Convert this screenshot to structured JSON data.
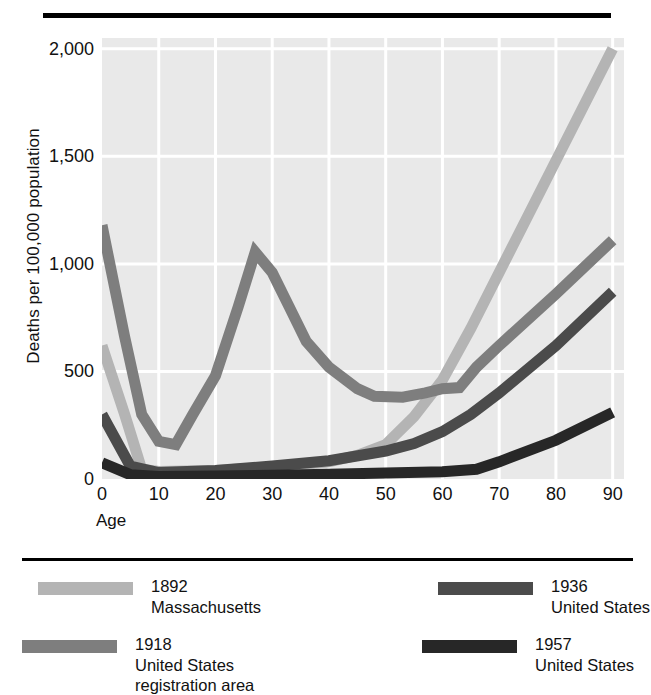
{
  "chart_data": {
    "type": "line",
    "title": "",
    "xlabel": "Age",
    "ylabel": "Deaths per 100,000 population",
    "xlim": [
      0,
      92
    ],
    "ylim": [
      0,
      2050
    ],
    "xticks": [
      0,
      10,
      20,
      30,
      40,
      50,
      60,
      70,
      80,
      90
    ],
    "xticklabels": [
      "0",
      "10",
      "20",
      "30",
      "40",
      "50",
      "60",
      "70",
      "80",
      "90"
    ],
    "yticks": [
      0,
      500,
      1000,
      1500,
      2000
    ],
    "yticklabels": [
      "0",
      "500",
      "1,000",
      "1,500",
      "2,000"
    ],
    "grid": true,
    "grid_color": "#ffffff",
    "plot_background": "#e9e9e9",
    "legend_position": "below-plot",
    "series": [
      {
        "name": "1892 Massachusetts",
        "year": "1892",
        "place": "Massachusetts",
        "color": "#b4b4b4",
        "x": [
          0,
          4,
          7,
          10,
          20,
          30,
          40,
          45,
          50,
          55,
          60,
          65,
          70,
          80,
          90
        ],
        "y": [
          620,
          300,
          45,
          35,
          40,
          55,
          80,
          110,
          160,
          290,
          460,
          700,
          960,
          1480,
          2000
        ]
      },
      {
        "name": "1918 United States registration area",
        "year": "1918",
        "place": "United States registration area",
        "color": "#7e7e7e",
        "x": [
          0,
          4,
          7,
          10,
          13,
          16,
          20,
          24,
          27,
          30,
          33,
          36,
          40,
          45,
          48,
          53,
          57,
          60,
          63,
          66,
          70,
          80,
          90
        ],
        "y": [
          1180,
          660,
          300,
          175,
          160,
          300,
          480,
          800,
          1055,
          960,
          800,
          640,
          520,
          420,
          385,
          380,
          400,
          420,
          425,
          520,
          620,
          860,
          1110
        ]
      },
      {
        "name": "1936 United States",
        "year": "1936",
        "place": "United States",
        "color": "#4b4b4b",
        "x": [
          0,
          5,
          10,
          20,
          30,
          40,
          50,
          55,
          60,
          65,
          70,
          80,
          90
        ],
        "y": [
          300,
          60,
          30,
          40,
          60,
          85,
          130,
          165,
          220,
          300,
          400,
          620,
          870
        ]
      },
      {
        "name": "1957 United States",
        "year": "1957",
        "place": "United States",
        "color": "#272727",
        "x": [
          0,
          5,
          10,
          20,
          30,
          40,
          50,
          60,
          66,
          70,
          80,
          90
        ],
        "y": [
          75,
          20,
          12,
          14,
          18,
          22,
          28,
          34,
          45,
          80,
          180,
          310
        ]
      }
    ]
  },
  "axes": {
    "y_title": "Deaths per 100,000 population",
    "x_title": "Age"
  },
  "legend": {
    "items": [
      {
        "swatch_color": "#b4b4b4",
        "year": "1892",
        "line2": "Massachusetts",
        "line3": ""
      },
      {
        "swatch_color": "#4b4b4b",
        "year": "1936",
        "line2": "United States",
        "line3": ""
      },
      {
        "swatch_color": "#7e7e7e",
        "year": "1918",
        "line2": "United States",
        "line3": "registration area"
      },
      {
        "swatch_color": "#272727",
        "year": "1957",
        "line2": "United States",
        "line3": ""
      }
    ]
  }
}
